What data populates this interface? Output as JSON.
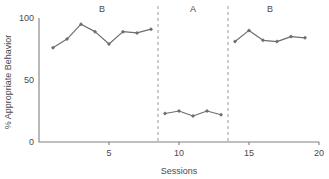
{
  "chart_data": {
    "type": "line",
    "title": "",
    "xlabel": "Sessions",
    "ylabel": "% Appropriate Behavior",
    "xlim": [
      0,
      20
    ],
    "ylim": [
      0,
      100
    ],
    "grid": false,
    "legend": null,
    "x_ticks": [
      5,
      10,
      15,
      20
    ],
    "x_tick_labels": [
      "5",
      "10",
      "15",
      "20"
    ],
    "y_ticks": [
      0,
      50,
      100
    ],
    "y_tick_labels": [
      "0",
      "50",
      "100"
    ],
    "marker": "diamond",
    "series": [
      {
        "name": "% Appropriate Behavior",
        "color": "#6e6e6e",
        "segments": [
          {
            "phase": "B",
            "x": [
              1,
              2,
              3,
              4,
              5,
              6,
              7,
              8
            ],
            "values": [
              76,
              83,
              95,
              89,
              79,
              89,
              88,
              91
            ]
          },
          {
            "phase": "A",
            "x": [
              9,
              10,
              11,
              12,
              13
            ],
            "values": [
              23,
              25,
              21,
              25,
              22
            ]
          },
          {
            "phase": "B",
            "x": [
              14,
              15,
              16,
              17,
              18,
              19
            ],
            "values": [
              81,
              90,
              82,
              81,
              85,
              84
            ]
          }
        ]
      }
    ],
    "phases": [
      {
        "label": "B",
        "center_x": 4.5,
        "start_x": 0.5,
        "end_x": 8.5
      },
      {
        "label": "A",
        "center_x": 11.0,
        "start_x": 8.5,
        "end_x": 13.5
      },
      {
        "label": "B",
        "center_x": 16.5,
        "start_x": 13.5,
        "end_x": 20.0
      }
    ],
    "phase_dividers": [
      8.5,
      13.5
    ],
    "annotations": []
  },
  "axis_titles": {
    "x": "Sessions",
    "y": "% Appropriate Behavior"
  },
  "colors": {
    "series": "#6e6e6e",
    "axis": "#808080",
    "divider": "#9a9a9a",
    "text": "#4a4a4a",
    "background": "#ffffff"
  }
}
